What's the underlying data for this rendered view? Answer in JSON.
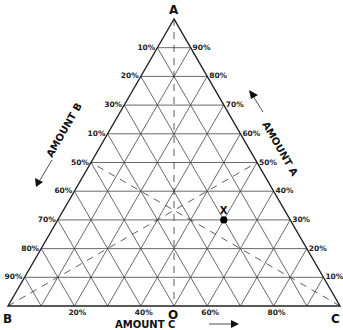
{
  "diagram": {
    "type": "ternary",
    "vertices": {
      "top": "A",
      "left": "B",
      "right": "C"
    },
    "center_label": "O",
    "axis_labels": {
      "left": "AMOUNT B",
      "right": "AMOUNT A",
      "bottom": "AMOUNT C"
    },
    "left_ticks": [
      "10%",
      "20%",
      "30%",
      "10%",
      "50%",
      "60%",
      "70%",
      "80%",
      "90%"
    ],
    "right_ticks": [
      "90%",
      "80%",
      "70%",
      "60%",
      "50%",
      "40%",
      "30%",
      "20%",
      "10%"
    ],
    "bottom_ticks": [
      {
        "label": "20%",
        "pos": 0.2
      },
      {
        "label": "40%",
        "pos": 0.4
      },
      {
        "label": "60%",
        "pos": 0.6
      },
      {
        "label": "80%",
        "pos": 0.8
      }
    ],
    "point": {
      "label": "X",
      "A": 30,
      "B": 20,
      "C": 50
    },
    "colors": {
      "line": "#222222",
      "background": "#ffffff"
    }
  }
}
